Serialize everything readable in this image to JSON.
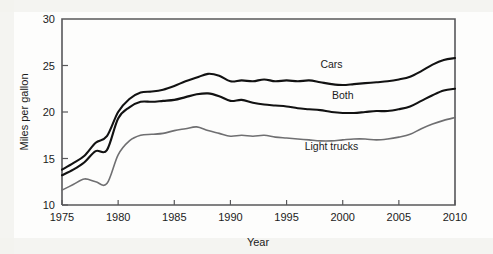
{
  "chart_data": {
    "type": "line",
    "title": "",
    "xlabel": "Year",
    "ylabel": "Miles per gallon",
    "xlim": [
      1975,
      2010
    ],
    "ylim": [
      10,
      30
    ],
    "grid": false,
    "legend_position": "inline-labels",
    "xticks": [
      1975,
      1980,
      1985,
      1990,
      1995,
      2000,
      2005,
      2010
    ],
    "xticklabels": [
      "1975",
      "1980",
      "1985",
      "1990",
      "1995",
      "2000",
      "2005",
      "2010"
    ],
    "yticks": [
      10,
      15,
      20,
      25,
      30
    ],
    "yticklabels": [
      "10",
      "15",
      "20",
      "25",
      "30"
    ],
    "x": [
      1975,
      1976,
      1977,
      1978,
      1979,
      1980,
      1981,
      1982,
      1983,
      1984,
      1985,
      1986,
      1987,
      1988,
      1989,
      1990,
      1991,
      1992,
      1993,
      1994,
      1995,
      1996,
      1997,
      1998,
      1999,
      2000,
      2001,
      2002,
      2003,
      2004,
      2005,
      2006,
      2007,
      2008,
      2009,
      2010
    ],
    "series": [
      {
        "name": "Cars",
        "color": "#121212",
        "label_x": 1999,
        "label_y": 24.7,
        "values": [
          13.8,
          14.5,
          15.3,
          16.7,
          17.4,
          20.0,
          21.4,
          22.1,
          22.2,
          22.4,
          22.8,
          23.3,
          23.7,
          24.1,
          23.9,
          23.3,
          23.4,
          23.3,
          23.5,
          23.3,
          23.4,
          23.3,
          23.4,
          23.2,
          23.0,
          22.9,
          23.0,
          23.1,
          23.2,
          23.3,
          23.5,
          23.8,
          24.4,
          25.1,
          25.6,
          25.8
        ]
      },
      {
        "name": "Both",
        "color": "#121212",
        "label_x": 2000,
        "label_y": 21.4,
        "values": [
          13.2,
          13.8,
          14.6,
          15.8,
          15.9,
          19.3,
          20.5,
          21.1,
          21.1,
          21.2,
          21.3,
          21.6,
          21.9,
          22.0,
          21.7,
          21.2,
          21.3,
          21.0,
          20.8,
          20.7,
          20.6,
          20.4,
          20.3,
          20.2,
          20.0,
          19.9,
          19.9,
          20.0,
          20.1,
          20.1,
          20.3,
          20.6,
          21.2,
          21.8,
          22.3,
          22.5
        ]
      },
      {
        "name": "Light trucks",
        "color": "#6f6f71",
        "label_x": 1999,
        "label_y": 15.9,
        "values": [
          11.6,
          12.2,
          12.8,
          12.5,
          12.3,
          15.4,
          16.9,
          17.5,
          17.6,
          17.7,
          18.0,
          18.2,
          18.4,
          18.0,
          17.7,
          17.4,
          17.5,
          17.4,
          17.5,
          17.3,
          17.2,
          17.1,
          17.0,
          16.9,
          16.9,
          17.0,
          17.1,
          17.1,
          17.0,
          17.1,
          17.3,
          17.6,
          18.2,
          18.7,
          19.1,
          19.4
        ]
      }
    ]
  }
}
